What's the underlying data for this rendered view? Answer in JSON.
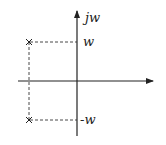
{
  "diagram": {
    "type": "s-plane pole plot",
    "axes": {
      "vertical_label": "jw",
      "horizontal_label": ""
    },
    "tick_labels": {
      "upper": "w",
      "lower": "-w"
    },
    "poles": [
      {
        "symbol": "×",
        "position": "upper-left",
        "imag": "w"
      },
      {
        "symbol": "×",
        "position": "lower-left",
        "imag": "-w"
      }
    ],
    "colors": {
      "line": "#222222",
      "background": "#ffffff"
    }
  }
}
